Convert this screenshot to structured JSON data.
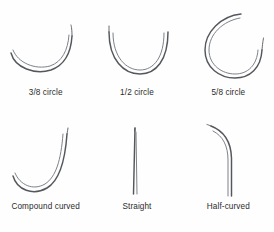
{
  "figure": {
    "background_color": "#fefefe",
    "needle_stroke_color": "#54575c",
    "needle_highlight_color": "#7d8188",
    "caption_color": "#2b2b2b",
    "columns": 3,
    "rows": 2
  },
  "items": [
    {
      "id": "three-eighths-circle",
      "label": "3/8 circle",
      "shape": "arc",
      "arc_fraction": "3/8",
      "description": "Shallow arc sweeping from left to upper right"
    },
    {
      "id": "one-half-circle",
      "label": "1/2 circle",
      "shape": "arc",
      "arc_fraction": "1/2",
      "description": "Semicircular arc, lower half of a circle"
    },
    {
      "id": "five-eighths-circle",
      "label": "5/8 circle",
      "shape": "arc",
      "arc_fraction": "5/8",
      "description": "Deep arc, nearly closed circle with gap at upper right"
    },
    {
      "id": "compound-curved",
      "label": "Compound curved",
      "shape": "compound",
      "arc_fraction": "",
      "description": "J-shaped hook with flat tail at lower left rising steeply at right"
    },
    {
      "id": "straight",
      "label": "Straight",
      "shape": "line",
      "arc_fraction": "0",
      "description": "Straight vertical needle tapering to a point at the top"
    },
    {
      "id": "half-curved",
      "label": "Half-curved",
      "shape": "half-curved",
      "arc_fraction": "",
      "description": "Straight shaft with a curved hook at the upper end"
    }
  ]
}
